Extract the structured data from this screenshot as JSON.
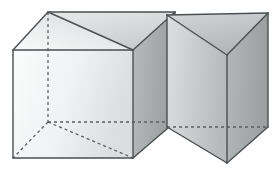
{
  "figure": {
    "background_color": "#ffffff",
    "canvas": {
      "width": 280,
      "height": 171
    },
    "line_color": "#4a4f52",
    "hidden_line_color": "#5a6063",
    "line_width": 1.4,
    "hidden_dash_pattern": "3,3",
    "solids": [
      {
        "id": "cube-with-diagonal",
        "name": "Cube with diagonal plane",
        "label": "",
        "faces": [
          {
            "id": "cube-front-face",
            "name": "front-face",
            "points": "13,50 13,158 133,158 133,50",
            "fill_start": "#fafbfb",
            "fill_end": "#dfe2e3",
            "gradient_id": "gradFrontCube"
          },
          {
            "id": "cube-right-face",
            "name": "right-face",
            "points": "133,50 133,158 133,158 133,50",
            "fill_start": "#b4b7b7",
            "fill_end": "#9ca0a0",
            "gradient_id": "gradRightCube"
          },
          {
            "id": "cube-top-left-triangle",
            "name": "top-face-left-triangle",
            "points": "13,50 48,12 133,50",
            "fill_start": "#f4f6f6",
            "fill_end": "#d8dbdc",
            "gradient_id": "gradTopLeft"
          }
        ],
        "visible_edges": [
          "M 13,50 L 13,158",
          "M 13,158 L 133,158",
          "M 133,158 L 133,50",
          "M 133,50 L 13,50",
          "M 13,50 L 48,12",
          "M 48,12 L 133,50",
          "M 48,12 L 175,12",
          "M 175,12 L 133,50"
        ],
        "hidden_edges": [
          "M 48,12 L 48,122",
          "M 48,122 L 13,158",
          "M 48,122 L 133,158",
          "M 48,122 L 133,122"
        ]
      },
      {
        "id": "triangular-prism",
        "name": "Triangular prism",
        "label": "",
        "faces": [
          {
            "id": "prism-left-face",
            "name": "left-front-face",
            "points": "167,15 227,55 227,163 167,127",
            "fill_start": "#d6d9da",
            "fill_end": "#b9bdbe",
            "gradient_id": "gradPrismLeft"
          },
          {
            "id": "prism-right-face",
            "name": "right-front-face",
            "points": "227,55 268,13 268,127 227,163",
            "fill_start": "#b0b4b5",
            "fill_end": "#9da1a2",
            "gradient_id": "gradPrismRight"
          },
          {
            "id": "prism-top-face",
            "name": "top-triangular-face",
            "points": "167,15 268,13 227,55",
            "fill_start": "#cfd3d4",
            "fill_end": "#b5b9ba",
            "gradient_id": "gradPrismTop"
          }
        ],
        "visible_edges": [
          "M 167,15 L 268,13",
          "M 268,13 L 227,55",
          "M 227,55 L 167,15",
          "M 167,15 L 167,127",
          "M 268,13 L 268,127",
          "M 227,55 L 227,163",
          "M 167,127 L 227,163",
          "M 227,163 L 268,127"
        ],
        "hidden_edges": [
          "M 167,127 L 268,127"
        ]
      }
    ]
  }
}
